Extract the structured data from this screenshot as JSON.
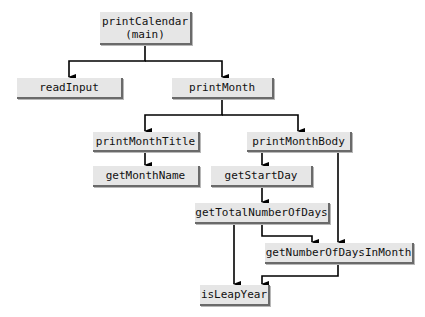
{
  "diagram": {
    "type": "call-hierarchy",
    "colors": {
      "node_fill": "#e6e6e6",
      "node_shadow": "#6a6a6a",
      "edge": "#000000",
      "background": "#ffffff"
    },
    "nodes": {
      "printCalendar": {
        "label": "printCalendar\n(main)"
      },
      "readInput": {
        "label": "readInput"
      },
      "printMonth": {
        "label": "printMonth"
      },
      "printMonthTitle": {
        "label": "printMonthTitle"
      },
      "printMonthBody": {
        "label": "printMonthBody"
      },
      "getMonthName": {
        "label": "getMonthName"
      },
      "getStartDay": {
        "label": "getStartDay"
      },
      "getTotalNumberOfDays": {
        "label": "getTotalNumberOfDays"
      },
      "getNumberOfDaysInMonth": {
        "label": "getNumberOfDaysInMonth"
      },
      "isLeapYear": {
        "label": "isLeapYear"
      }
    },
    "edges": [
      [
        "printCalendar",
        "readInput"
      ],
      [
        "printCalendar",
        "printMonth"
      ],
      [
        "printMonth",
        "printMonthTitle"
      ],
      [
        "printMonth",
        "printMonthBody"
      ],
      [
        "printMonthTitle",
        "getMonthName"
      ],
      [
        "printMonthBody",
        "getStartDay"
      ],
      [
        "printMonthBody",
        "getNumberOfDaysInMonth"
      ],
      [
        "getStartDay",
        "getTotalNumberOfDays"
      ],
      [
        "getTotalNumberOfDays",
        "getNumberOfDaysInMonth"
      ],
      [
        "getTotalNumberOfDays",
        "isLeapYear"
      ],
      [
        "getNumberOfDaysInMonth",
        "isLeapYear"
      ]
    ]
  }
}
